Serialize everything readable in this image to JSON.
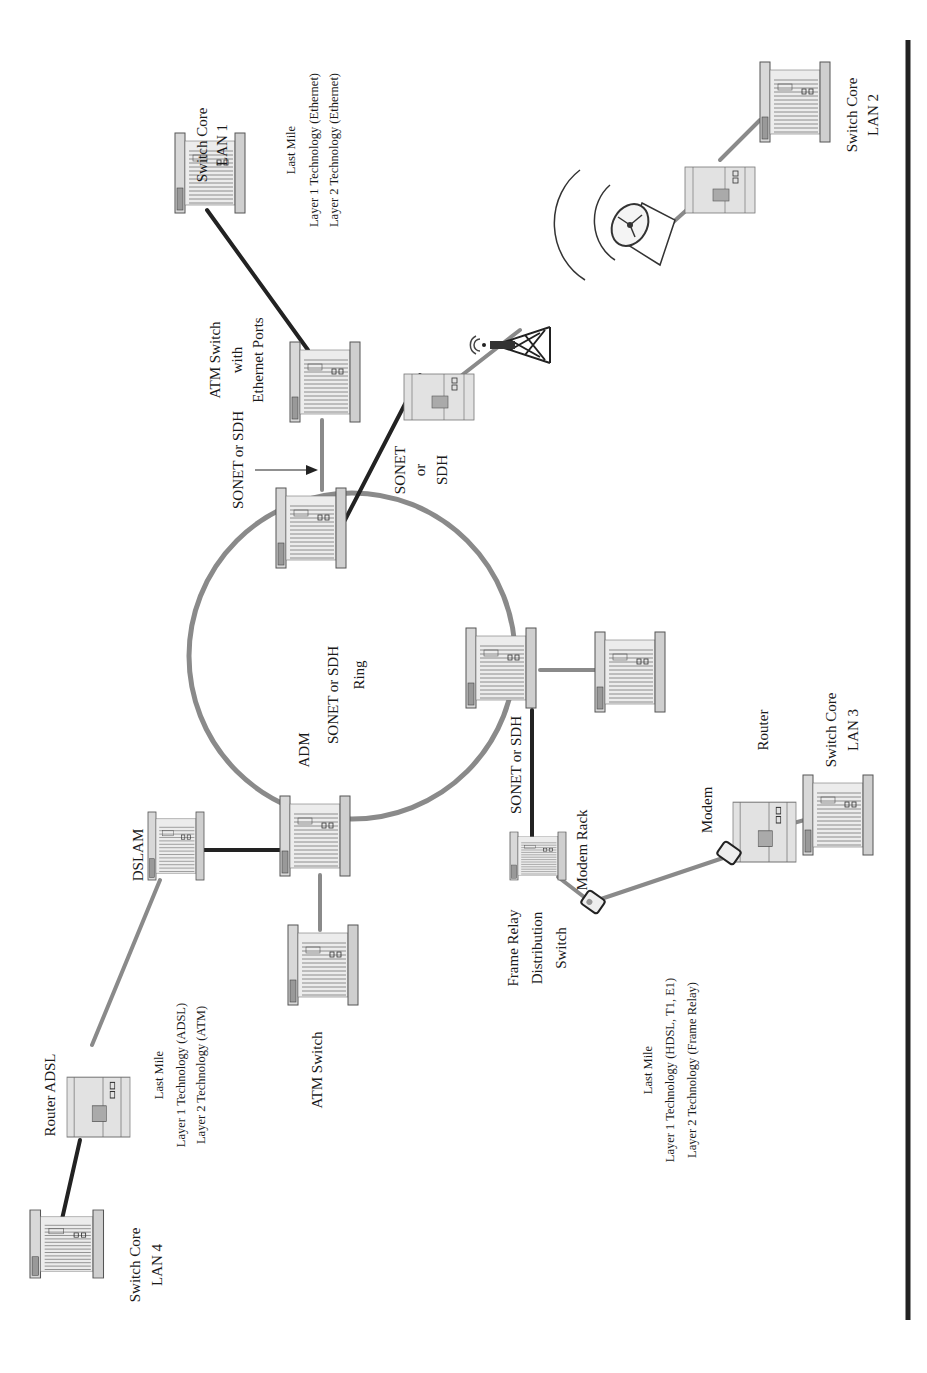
{
  "diagram": {
    "orientation": "rotated-90-ccw",
    "ring": {
      "label_line1": "SONET or SDH",
      "label_line2": "Ring"
    },
    "nodes": {
      "switch_core_lan1": {
        "line1": "Switch Core",
        "line2": "LAN 1"
      },
      "switch_core_lan2": {
        "line1": "Switch Core",
        "line2": "LAN 2"
      },
      "switch_core_lan3": {
        "line1": "Switch Core",
        "line2": "LAN 3"
      },
      "switch_core_lan4": {
        "line1": "Switch Core",
        "line2": "LAN 4"
      },
      "atm_switch_eth": {
        "line1": "ATM Switch",
        "line2": "with",
        "line3": "Ethernet Ports"
      },
      "atm_switch": {
        "label": "ATM Switch"
      },
      "adm": {
        "label": "ADM"
      },
      "dslam": {
        "label": "DSLAM"
      },
      "router_adsl": {
        "label": "Router ADSL"
      },
      "frame_relay": {
        "line1": "Frame Relay",
        "line2": "Distribution",
        "line3": "Switch"
      },
      "modem_rack": {
        "label": "Modem Rack"
      },
      "modem": {
        "label": "Modem"
      },
      "router": {
        "label": "Router"
      }
    },
    "link_labels": {
      "top_sonet": "SONET or SDH",
      "wireless_sonet": {
        "line1": "SONET",
        "line2": "or",
        "line3": "SDH"
      },
      "frame_relay_sonet": "SONET or SDH"
    },
    "last_mile": [
      {
        "title": "Last Mile",
        "layer1": "Layer 1 Technology (Ethernet)",
        "layer2": "Layer 2 Technology (Ethernet)"
      },
      {
        "title": "Last Mile",
        "layer1": "Layer 1 Technology (ADSL)",
        "layer2": "Layer 2 Technology (ATM)"
      },
      {
        "title": "Last Mile",
        "layer1": "Layer 1 Technology (HDSL, T1, E1)",
        "layer2": "Layer 2 Technology (Frame Relay)"
      }
    ]
  }
}
